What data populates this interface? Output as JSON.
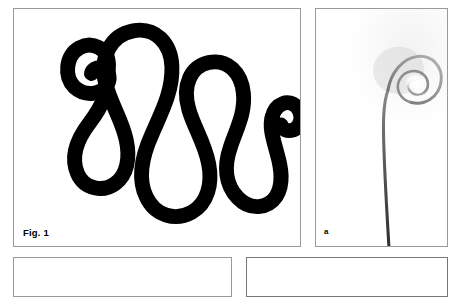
{
  "page": {
    "background_color": "#ffffff",
    "width": 461,
    "height": 265
  },
  "panels": [
    {
      "id": "fig1",
      "label": "Fig. 1",
      "kind": "line-drawing",
      "description": "Serpentine black curve with inward spiral curls at both ends",
      "border_color": "#9a9a9a",
      "background_color": "#ffffff",
      "stroke_color": "#000000",
      "stroke_width": 15
    },
    {
      "id": "a",
      "label": "a",
      "kind": "photograph",
      "description": "Thin grey filament rising vertically and curling into a tight spiral at the top",
      "border_color": "#9a9a9a",
      "background_color": "#ffffff",
      "filament_color": "#6b6b6b"
    },
    {
      "id": "bottom-left",
      "label": "",
      "kind": "clipped-panel",
      "description": "Top border of the next figure panel, cropped by the page edge",
      "border_color": "#9a9a9a",
      "background_color": "#ffffff"
    },
    {
      "id": "bottom-right",
      "label": "",
      "kind": "clipped-panel",
      "description": "Top border of the next figure panel, cropped by the page edge",
      "border_color": "#777777",
      "background_color": "#ffffff"
    }
  ],
  "figure1": {
    "curve_path": "M 96 56 C 96 41 80 34 68 41 C 55 48 53 68 64 78 C 74 87 89 85 94 76 C 97 70 95 63 89 61 C 84 59 79 62 78 66 M 96 56 C 96 84 88 98 76 114 C 64 130 58 148 64 164 C 70 180 88 184 100 176 C 112 168 116 152 112 134 C 108 114 96 96 92 76 C 86 48 98 28 118 24 C 139 20 156 35 158 58 C 160 82 149 104 140 124 C 130 146 124 168 132 188 C 140 208 160 214 176 206 C 193 198 199 178 196 158 C 193 137 182 120 177 102 C 170 78 178 59 196 55 C 214 51 228 64 230 84 C 232 104 224 120 218 138 C 211 158 212 176 224 190 C 236 204 254 202 262 190 C 270 178 268 162 264 148 C 260 133 256 120 259 110 C 263 96 276 92 284 100 C 291 107 289 118 282 122 C 277 125 271 123 269 119",
    "curl_left_detail": "counter-clockwise inward spiral at left terminus",
    "curl_right_detail": "clockwise inward spiral at right terminus"
  },
  "figure_a": {
    "stem_path": "M 72 238 C 70 200 68 160 68 128 C 68 102 70 84 78 72",
    "curl_path": "M 78 72 C 86 58 102 52 113 58 C 126 65 129 82 120 92 C 111 102 95 100 90 90 C 86 81 90 72 98 70 C 105 68 111 73 111 79",
    "highlight": "soft white glow inside the spiral loop"
  }
}
